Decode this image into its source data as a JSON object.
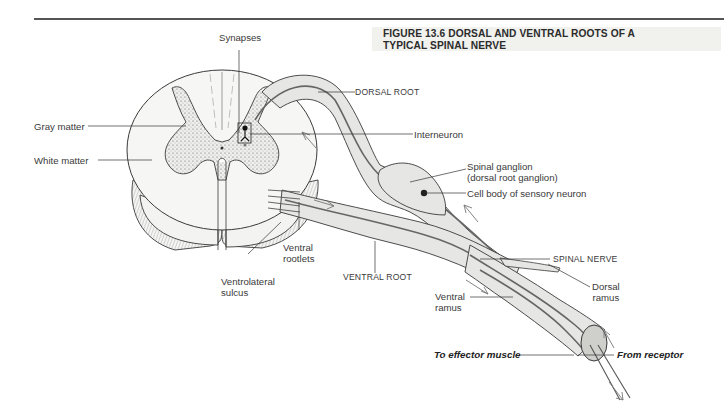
{
  "figure": {
    "title_line1": "FIGURE 13.6  DORSAL AND VENTRAL ROOTS OF A",
    "title_line2": "TYPICAL SPINAL NERVE"
  },
  "labels": {
    "synapses": "Synapses",
    "gray_matter": "Gray matter",
    "white_matter": "White matter",
    "dorsal_root": "DORSAL ROOT",
    "interneuron": "Interneuron",
    "spinal_ganglion": "Spinal ganglion",
    "spinal_ganglion_alt": "(dorsal root ganglion)",
    "cell_body": "Cell body of sensory neuron",
    "spinal_nerve": "SPINAL NERVE",
    "dorsal_ramus_1": "Dorsal",
    "dorsal_ramus_2": "ramus",
    "ventral_rootlets_1": "Ventral",
    "ventral_rootlets_2": "rootlets",
    "ventrolateral_sulcus_1": "Ventrolateral",
    "ventrolateral_sulcus_2": "sulcus",
    "ventral_root": "VENTRAL ROOT",
    "ventral_ramus_1": "Ventral",
    "ventral_ramus_2": "ramus",
    "to_effector": "To effector muscle",
    "from_receptor": "From receptor"
  },
  "colors": {
    "nerve_fill": "#e6e6e4",
    "gray_matter_fill": "#d9d9d6",
    "outline": "#3a3a3a",
    "fiber": "#6e6e6e"
  }
}
